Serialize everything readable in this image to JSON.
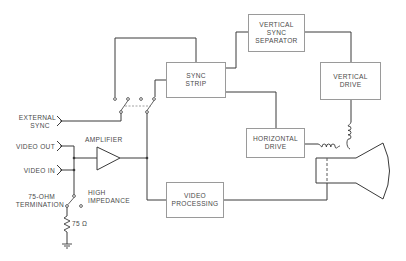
{
  "diagram": {
    "blocks": {
      "sync_strip": {
        "line1": "SYNC",
        "line2": "STRIP"
      },
      "vertical_sync_separator": {
        "line1": "VERTICAL",
        "line2": "SYNC",
        "line3": "SEPARATOR"
      },
      "vertical_drive": {
        "line1": "VERTICAL",
        "line2": "DRIVE"
      },
      "horizontal_drive": {
        "line1": "HORIZONTAL",
        "line2": "DRIVE"
      },
      "video_processing": {
        "line1": "VIDEO",
        "line2": "PROCESSING"
      }
    },
    "labels": {
      "external_sync_1": "EXTERNAL",
      "external_sync_2": "SYNC",
      "video_out": "VIDEO OUT",
      "video_in": "VIDEO IN",
      "amplifier": "AMPLIFIER",
      "termination_1": "75-OHM",
      "termination_2": "TERMINATION",
      "high_impedance_1": "HIGH",
      "high_impedance_2": "IMPEDANCE",
      "resistor": "75 Ω"
    },
    "colors": {
      "line": "#3a3a3a",
      "box_border": "#9a9a9a",
      "text": "#4a4a4a",
      "dashed": "#8a8a8a"
    }
  }
}
